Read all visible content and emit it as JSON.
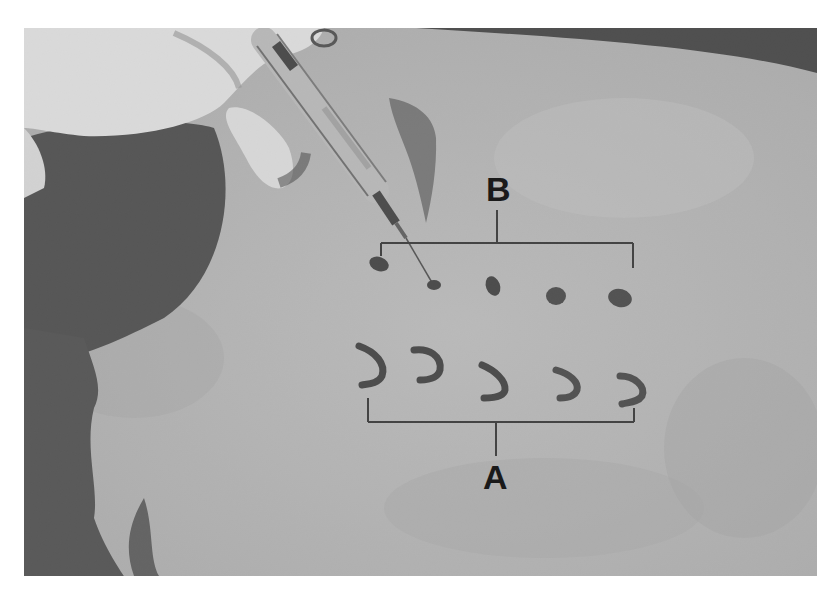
{
  "figure": {
    "type": "grayscale-photograph",
    "labels": {
      "a": "A",
      "b": "B"
    },
    "marks": {
      "row_b": {
        "count": 5,
        "shape": "dot"
      },
      "row_a": {
        "count": 5,
        "shape": "crescent"
      }
    },
    "colors": {
      "skin": "#b4b4b4",
      "hair": "#3a3a3a",
      "glove": "#e8e8e8",
      "ink": "#2a2a2a",
      "bracket": "#222222"
    }
  }
}
